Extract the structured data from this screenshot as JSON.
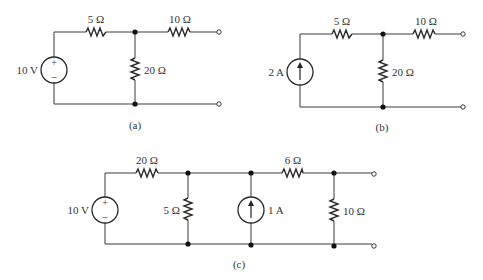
{
  "figure": {
    "circuits": [
      {
        "id": "a",
        "caption": "(a)",
        "source": {
          "type": "voltage",
          "label": "10 V",
          "plus": "+",
          "minus": "–"
        },
        "series_resistor": {
          "label": "5 Ω"
        },
        "shunt_resistor": {
          "label": "20 Ω"
        },
        "output_resistor": {
          "label": "10 Ω"
        }
      },
      {
        "id": "b",
        "caption": "(b)",
        "source": {
          "type": "current",
          "label": "2 A",
          "direction": "up"
        },
        "series_resistor": {
          "label": "5 Ω"
        },
        "shunt_resistor": {
          "label": "20 Ω"
        },
        "output_resistor": {
          "label": "10 Ω"
        }
      },
      {
        "id": "c",
        "caption": "(c)",
        "voltage_source": {
          "label": "10 V",
          "plus": "+",
          "minus": "–"
        },
        "series_resistor_1": {
          "label": "20 Ω"
        },
        "shunt_resistor_1": {
          "label": "5 Ω"
        },
        "current_source": {
          "label": "1 A",
          "direction": "up"
        },
        "series_resistor_2": {
          "label": "6 Ω"
        },
        "shunt_resistor_2": {
          "label": "10 Ω"
        }
      }
    ]
  }
}
